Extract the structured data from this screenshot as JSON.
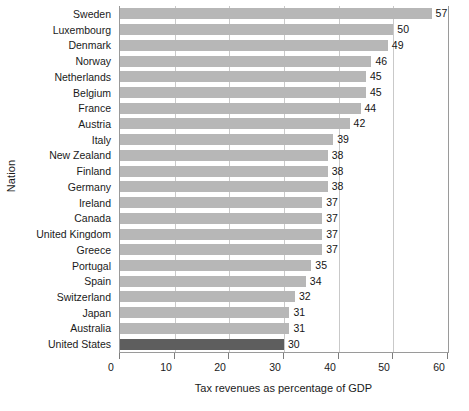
{
  "chart_data": {
    "type": "bar",
    "orientation": "horizontal",
    "title": "",
    "xlabel": "Tax revenues as percentage of GDP",
    "ylabel": "Nation",
    "xlim": [
      0,
      60
    ],
    "xticks": [
      0,
      10,
      20,
      30,
      40,
      50,
      60
    ],
    "grid": true,
    "legend": "none",
    "categories": [
      "Sweden",
      "Luxembourg",
      "Denmark",
      "Norway",
      "Netherlands",
      "Belgium",
      "France",
      "Austria",
      "Italy",
      "New Zealand",
      "Finland",
      "Germany",
      "Ireland",
      "Canada",
      "United Kingdom",
      "Greece",
      "Portugal",
      "Spain",
      "Switzerland",
      "Japan",
      "Australia",
      "United States"
    ],
    "values": [
      57,
      50,
      49,
      46,
      45,
      45,
      44,
      42,
      39,
      38,
      38,
      38,
      37,
      37,
      37,
      37,
      35,
      34,
      32,
      31,
      31,
      30
    ],
    "highlighted_category": "United States",
    "colors": {
      "bar": "#b7b7b7",
      "bar_highlight": "#5e5e5e",
      "gridline": "#c9c9c9",
      "axis": "#9a9a9a",
      "text": "#1a1a1a"
    }
  }
}
